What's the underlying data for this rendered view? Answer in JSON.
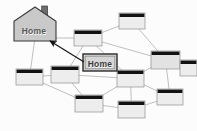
{
  "diagram": {
    "background_color": "#fcfcfc",
    "house": {
      "icon": "house-icon",
      "label": "Home",
      "fill_color": "#c9c9c9",
      "stroke_color": "#3a3a3a",
      "chimney_color": "#6e6e6e",
      "x": 14,
      "y": 7,
      "width": 42,
      "height": 34
    },
    "callout": {
      "label": "Home",
      "fill_color": "#d6d6d6",
      "stroke_color": "#2b2b2b",
      "inner_stroke_color": "#8a8a8a",
      "x": 83,
      "y": 54,
      "width": 34,
      "height": 17
    },
    "arrow": {
      "name": "pointer-arrow",
      "color": "#1a1a1a",
      "from_x": 84,
      "from_y": 62,
      "to_x": 50,
      "to_y": 41
    },
    "link_color": "#b8b8b8",
    "node_style": {
      "body_color": "#ededed",
      "body_color_alt": "#e2e2e2",
      "header_color": "#121212",
      "border_color": "#8f8f8f"
    },
    "nodes": [
      {
        "id": "n1",
        "name": "network-node-1",
        "x": 74,
        "y": 30,
        "w": 28,
        "h": 16,
        "shade": "light"
      },
      {
        "id": "n2",
        "name": "network-node-2",
        "x": 119,
        "y": 13,
        "w": 26,
        "h": 16,
        "shade": "light"
      },
      {
        "id": "n3",
        "name": "network-node-3",
        "x": 151,
        "y": 51,
        "w": 29,
        "h": 18,
        "shade": "dark"
      },
      {
        "id": "n4",
        "name": "network-node-4",
        "x": 16,
        "y": 69,
        "w": 27,
        "h": 16,
        "shade": "light"
      },
      {
        "id": "n5",
        "name": "network-node-5",
        "x": 51,
        "y": 66,
        "w": 28,
        "h": 17,
        "shade": "light"
      },
      {
        "id": "n6",
        "name": "network-node-6",
        "x": 117,
        "y": 70,
        "w": 27,
        "h": 17,
        "shade": "light"
      },
      {
        "id": "n7",
        "name": "network-node-7",
        "x": 75,
        "y": 95,
        "w": 28,
        "h": 17,
        "shade": "light"
      },
      {
        "id": "n8",
        "name": "network-node-8",
        "x": 118,
        "y": 101,
        "w": 27,
        "h": 17,
        "shade": "light"
      },
      {
        "id": "n9",
        "name": "network-node-9",
        "x": 157,
        "y": 89,
        "w": 26,
        "h": 16,
        "shade": "light"
      },
      {
        "id": "n10",
        "name": "network-node-10",
        "x": 180,
        "y": 60,
        "w": 17,
        "h": 16,
        "shade": "light"
      }
    ],
    "links": [
      [
        "house",
        "n4"
      ],
      [
        "house",
        "n1"
      ],
      [
        "n1",
        "n2"
      ],
      [
        "n1",
        "n5"
      ],
      [
        "n1",
        "n6"
      ],
      [
        "n1",
        "n3"
      ],
      [
        "n2",
        "n3"
      ],
      [
        "n3",
        "n6"
      ],
      [
        "n3",
        "n9"
      ],
      [
        "n3",
        "n10"
      ],
      [
        "n4",
        "n5"
      ],
      [
        "n4",
        "n7"
      ],
      [
        "n5",
        "n6"
      ],
      [
        "n5",
        "n7"
      ],
      [
        "n6",
        "n8"
      ],
      [
        "n6",
        "n9"
      ],
      [
        "n7",
        "n8"
      ],
      [
        "n8",
        "n9"
      ],
      [
        "n7",
        "n6"
      ]
    ]
  }
}
